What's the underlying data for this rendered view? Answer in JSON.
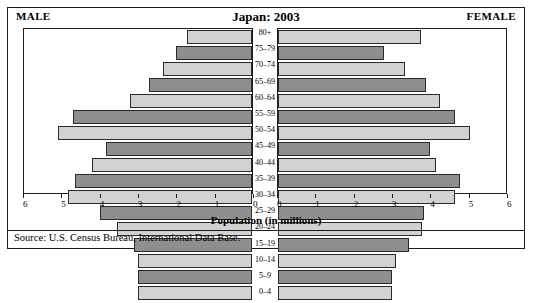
{
  "figure": {
    "title": "Japan: 2003",
    "male_label": "MALE",
    "female_label": "FEMALE",
    "axis_title": "Population (in millions)",
    "source": "Source: U.S. Census Bureau, International Data Base."
  },
  "colors": {
    "bar_light": "#d2d2d2",
    "bar_dark": "#8e8e8e",
    "bar_border": "#2a2a2a",
    "frame": "#1c1c1c",
    "background": "#ffffff"
  },
  "chart_data": {
    "type": "bar",
    "subtype": "population-pyramid",
    "title": "Japan: 2003",
    "xlabel": "Population (in millions)",
    "ylabel": "",
    "xlim": [
      0,
      6
    ],
    "grid": false,
    "legend": false,
    "left_panel_label": "MALE",
    "right_panel_label": "FEMALE",
    "tick_labels_male": [
      "6",
      "5",
      "4",
      "3",
      "2",
      "1",
      "0"
    ],
    "tick_labels_female": [
      "0",
      "1",
      "2",
      "3",
      "4",
      "5",
      "6"
    ],
    "tick_values": [
      6,
      5,
      4,
      3,
      2,
      1,
      0
    ],
    "categories": [
      "80+",
      "75-79",
      "70-74",
      "65-69",
      "60-64",
      "55-59",
      "50-54",
      "45-49",
      "40-44",
      "35-39",
      "30-34",
      "25-29",
      "20-24",
      "15-19",
      "10-14",
      "5-9",
      "0-4"
    ],
    "series": [
      {
        "name": "MALE",
        "values": [
          1.7,
          2.0,
          2.35,
          2.7,
          3.2,
          4.7,
          5.1,
          3.85,
          4.2,
          4.65,
          4.85,
          4.0,
          3.55,
          3.1,
          3.0,
          3.0,
          3.0
        ]
      },
      {
        "name": "FEMALE",
        "values": [
          3.75,
          2.8,
          3.35,
          3.9,
          4.25,
          4.65,
          5.05,
          4.0,
          4.15,
          4.8,
          4.65,
          3.85,
          3.8,
          3.45,
          3.1,
          3.0,
          3.0
        ]
      }
    ],
    "bar_shades": [
      "light",
      "dark",
      "light",
      "dark",
      "light",
      "dark",
      "light",
      "dark",
      "light",
      "dark",
      "light",
      "dark",
      "light",
      "dark",
      "light",
      "dark",
      "light"
    ],
    "source": "Source: U.S. Census Bureau, International Data Base."
  }
}
